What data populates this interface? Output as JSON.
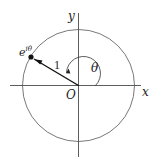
{
  "diagram": {
    "type": "unit-circle",
    "labels": {
      "x_axis": "x",
      "y_axis": "y",
      "origin": "O",
      "radius": "1",
      "angle": "θ",
      "point_base": "e",
      "point_exp": "iθ"
    },
    "colors": {
      "stroke": "#333333",
      "circle": "#555555",
      "background": "#ffffff"
    }
  }
}
